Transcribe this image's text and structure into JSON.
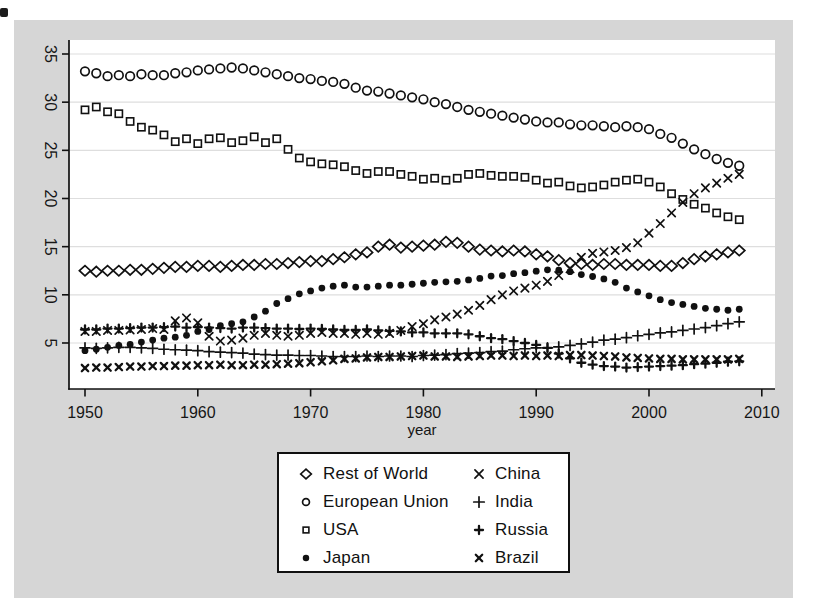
{
  "figure": {
    "xlabel": "year",
    "colors": {
      "page_scan_gray": "#d6d6d6",
      "plot_background": "#ffffff",
      "ink": "#111111",
      "gridline": "#dedede"
    }
  },
  "chart_data": {
    "type": "scatter",
    "title": "",
    "xlabel": "year",
    "ylabel": "",
    "grid": "horizontal",
    "legend_position": "below",
    "x_ticks": [
      1950,
      1960,
      1970,
      1980,
      1990,
      2000,
      2010
    ],
    "y_ticks": [
      35,
      30,
      25,
      20,
      15,
      10,
      5
    ],
    "xlim": [
      1948.6,
      2011.3
    ],
    "ylim": [
      0.2,
      36.5
    ],
    "x": [
      1950,
      1951,
      1952,
      1953,
      1954,
      1955,
      1956,
      1957,
      1958,
      1959,
      1960,
      1961,
      1962,
      1963,
      1964,
      1965,
      1966,
      1967,
      1968,
      1969,
      1970,
      1971,
      1972,
      1973,
      1974,
      1975,
      1976,
      1977,
      1978,
      1979,
      1980,
      1981,
      1982,
      1983,
      1984,
      1985,
      1986,
      1987,
      1988,
      1989,
      1990,
      1991,
      1992,
      1993,
      1994,
      1995,
      1996,
      1997,
      1998,
      1999,
      2000,
      2001,
      2002,
      2003,
      2004,
      2005,
      2006,
      2007,
      2008
    ],
    "series": [
      {
        "name": "European Union",
        "marker": "circle",
        "values": [
          33.2,
          33.0,
          32.7,
          32.8,
          32.7,
          32.9,
          32.8,
          32.8,
          33.0,
          33.1,
          33.3,
          33.4,
          33.5,
          33.6,
          33.5,
          33.3,
          33.1,
          32.9,
          32.7,
          32.5,
          32.4,
          32.2,
          32.1,
          31.9,
          31.5,
          31.2,
          31.1,
          30.9,
          30.7,
          30.5,
          30.3,
          30.0,
          29.8,
          29.5,
          29.2,
          29.0,
          28.8,
          28.6,
          28.4,
          28.2,
          28.0,
          27.9,
          27.9,
          27.7,
          27.6,
          27.6,
          27.5,
          27.4,
          27.5,
          27.4,
          27.2,
          26.7,
          26.3,
          25.7,
          25.1,
          24.6,
          24.1,
          23.7,
          23.4
        ]
      },
      {
        "name": "USA",
        "marker": "square",
        "values": [
          29.2,
          29.5,
          29.0,
          28.8,
          28.0,
          27.4,
          27.1,
          26.6,
          25.9,
          26.2,
          25.7,
          26.2,
          26.3,
          25.8,
          26.0,
          26.4,
          25.8,
          26.2,
          25.1,
          24.2,
          23.8,
          23.6,
          23.5,
          23.3,
          22.9,
          22.6,
          22.8,
          22.8,
          22.5,
          22.3,
          22.0,
          22.1,
          21.9,
          22.1,
          22.5,
          22.6,
          22.4,
          22.3,
          22.3,
          22.2,
          21.9,
          21.6,
          21.7,
          21.3,
          21.1,
          21.2,
          21.4,
          21.7,
          21.9,
          22.0,
          21.7,
          21.2,
          20.5,
          19.9,
          19.4,
          19.0,
          18.5,
          18.1,
          17.8
        ]
      },
      {
        "name": "Rest of World",
        "marker": "diamond",
        "values": [
          12.5,
          12.4,
          12.5,
          12.5,
          12.6,
          12.6,
          12.7,
          12.8,
          12.9,
          12.9,
          13.0,
          13.0,
          12.9,
          13.0,
          13.1,
          13.1,
          13.2,
          13.2,
          13.3,
          13.4,
          13.5,
          13.5,
          13.7,
          13.9,
          14.2,
          14.4,
          15.0,
          15.2,
          14.9,
          15.0,
          15.1,
          15.2,
          15.5,
          15.4,
          15.0,
          14.7,
          14.6,
          14.5,
          14.6,
          14.5,
          14.2,
          14.0,
          13.6,
          13.3,
          13.2,
          13.1,
          13.2,
          13.2,
          13.1,
          13.1,
          13.1,
          13.0,
          13.0,
          13.3,
          13.7,
          14.0,
          14.2,
          14.4,
          14.6
        ]
      },
      {
        "name": "Japan",
        "marker": "dot",
        "values": [
          4.2,
          4.35,
          4.55,
          4.75,
          4.85,
          5.1,
          5.3,
          5.5,
          5.6,
          5.8,
          6.2,
          6.4,
          6.8,
          7.0,
          7.2,
          7.7,
          8.3,
          9.1,
          9.6,
          10.1,
          10.4,
          10.7,
          10.9,
          11.0,
          10.8,
          10.8,
          10.9,
          11.0,
          11.0,
          11.1,
          11.2,
          11.3,
          11.35,
          11.4,
          11.55,
          11.7,
          11.95,
          12.0,
          12.2,
          12.3,
          12.45,
          12.6,
          12.55,
          12.4,
          12.1,
          11.9,
          11.65,
          11.3,
          10.7,
          10.3,
          9.9,
          9.5,
          9.2,
          9.0,
          8.8,
          8.6,
          8.5,
          8.4,
          8.5
        ]
      },
      {
        "name": "India",
        "marker": "plus",
        "values": [
          4.5,
          4.45,
          4.5,
          4.55,
          4.55,
          4.5,
          4.45,
          4.35,
          4.3,
          4.25,
          4.2,
          4.1,
          4.05,
          4.0,
          3.95,
          3.85,
          3.8,
          3.75,
          3.75,
          3.7,
          3.7,
          3.65,
          3.6,
          3.6,
          3.6,
          3.65,
          3.6,
          3.65,
          3.65,
          3.6,
          3.7,
          3.75,
          3.8,
          3.9,
          3.95,
          4.0,
          4.1,
          4.15,
          4.3,
          4.4,
          4.5,
          4.5,
          4.6,
          4.75,
          4.9,
          5.1,
          5.3,
          5.4,
          5.55,
          5.75,
          5.9,
          6.05,
          6.15,
          6.3,
          6.45,
          6.6,
          6.8,
          7.0,
          7.2
        ]
      },
      {
        "name": "Russia",
        "marker": "plus-bold",
        "values": [
          6.4,
          6.4,
          6.5,
          6.5,
          6.55,
          6.6,
          6.6,
          6.65,
          6.7,
          6.6,
          6.65,
          6.6,
          6.55,
          6.5,
          6.6,
          6.6,
          6.55,
          6.5,
          6.5,
          6.45,
          6.5,
          6.45,
          6.4,
          6.35,
          6.35,
          6.4,
          6.3,
          6.25,
          6.2,
          6.1,
          6.1,
          6.0,
          6.0,
          6.0,
          5.9,
          5.7,
          5.5,
          5.4,
          5.2,
          5.0,
          4.8,
          4.5,
          3.9,
          3.4,
          2.95,
          2.75,
          2.6,
          2.55,
          2.45,
          2.5,
          2.55,
          2.6,
          2.65,
          2.7,
          2.8,
          2.85,
          2.95,
          3.05,
          3.1
        ]
      },
      {
        "name": "Brazil",
        "marker": "x-bold",
        "values": [
          2.4,
          2.45,
          2.45,
          2.5,
          2.55,
          2.55,
          2.6,
          2.6,
          2.65,
          2.65,
          2.7,
          2.7,
          2.75,
          2.7,
          2.7,
          2.75,
          2.75,
          2.8,
          2.85,
          2.9,
          3.0,
          3.1,
          3.2,
          3.35,
          3.4,
          3.5,
          3.55,
          3.55,
          3.6,
          3.65,
          3.7,
          3.6,
          3.6,
          3.55,
          3.6,
          3.65,
          3.7,
          3.7,
          3.65,
          3.7,
          3.65,
          3.7,
          3.65,
          3.75,
          3.75,
          3.7,
          3.65,
          3.6,
          3.5,
          3.45,
          3.4,
          3.35,
          3.35,
          3.3,
          3.3,
          3.3,
          3.3,
          3.3,
          3.35
        ]
      },
      {
        "name": "China",
        "marker": "x",
        "values": [
          6.2,
          6.2,
          6.3,
          6.3,
          6.35,
          6.4,
          6.5,
          6.4,
          7.3,
          7.6,
          7.1,
          5.7,
          5.2,
          5.3,
          5.5,
          5.8,
          6.0,
          5.8,
          5.7,
          5.8,
          6.0,
          6.1,
          6.0,
          6.0,
          5.9,
          6.0,
          5.9,
          6.0,
          6.3,
          6.7,
          7.0,
          7.4,
          7.7,
          8.0,
          8.4,
          8.9,
          9.5,
          10.0,
          10.4,
          10.7,
          11.0,
          11.4,
          12.0,
          12.7,
          13.9,
          14.3,
          14.45,
          14.6,
          14.9,
          15.4,
          16.4,
          17.4,
          18.5,
          19.6,
          20.5,
          21.1,
          21.6,
          22.1,
          22.5
        ]
      }
    ]
  },
  "legend": {
    "columns": [
      [
        {
          "label": "Rest of World",
          "marker": "diamond"
        },
        {
          "label": "European Union",
          "marker": "circle"
        },
        {
          "label": "USA",
          "marker": "square"
        },
        {
          "label": "Japan",
          "marker": "dot"
        }
      ],
      [
        {
          "label": "China",
          "marker": "x"
        },
        {
          "label": "India",
          "marker": "plus"
        },
        {
          "label": "Russia",
          "marker": "plus-bold"
        },
        {
          "label": "Brazil",
          "marker": "x-bold"
        }
      ]
    ]
  }
}
